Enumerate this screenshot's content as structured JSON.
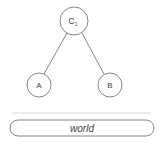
{
  "diagram": {
    "root": {
      "label": "C",
      "subscript": "1"
    },
    "children": [
      {
        "label": "A"
      },
      {
        "label": "B"
      }
    ],
    "base": {
      "label": "world"
    }
  },
  "colors": {
    "stroke": "#666666",
    "text": "#444444",
    "divider": "#d0d0d0"
  }
}
